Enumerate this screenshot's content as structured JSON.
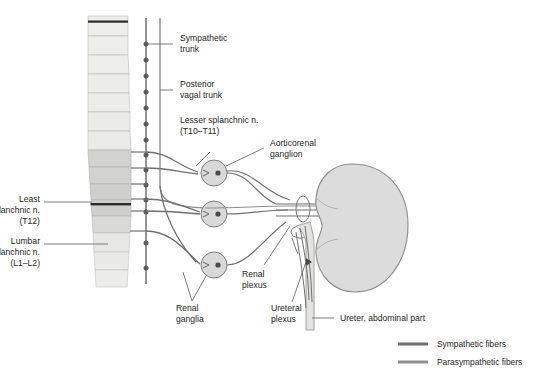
{
  "figure": {
    "type": "anatomical-diagram"
  },
  "colors": {
    "background": "#ffffff",
    "vertebra_light": "#eeeeec",
    "vertebra_mid": "#d6d6d4",
    "vertebra_dark": "#c2c2c0",
    "vertebra_band": "#2b2b2b",
    "kidney_fill": "#dcdcdc",
    "kidney_stroke": "#8c8c8c",
    "ganglion_fill": "#d9d9d9",
    "ganglion_stroke": "#6e6e6e",
    "sympathetic": "#6f6f6f",
    "parasympathetic": "#8f8f8f",
    "leader_line": "#5a5a5a",
    "text": "#231f20"
  },
  "labels": {
    "sympathetic_trunk": {
      "line1": "Sympathetic",
      "line2": "trunk"
    },
    "posterior_vagal_trunk": {
      "line1": "Posterior",
      "line2": "vagal trunk"
    },
    "lesser_splanchnic": {
      "line1": "Lesser splanchnic n.",
      "line2": "(T10–T11)"
    },
    "aorticorenal_ganglion": {
      "line1": "Aorticorenal",
      "line2": "ganglion"
    },
    "least_splanchnic": {
      "line1": "Least",
      "line2": "splanchnic n.",
      "line3": "(T12)"
    },
    "lumbar_splanchnic": {
      "line1": "Lumbar",
      "line2": "splanchnic n.",
      "line3": "(L1–L2)"
    },
    "renal_ganglia": {
      "line1": "Renal",
      "line2": "ganglia"
    },
    "renal_plexus": {
      "line1": "Renal",
      "line2": "plexus"
    },
    "ureteral_plexus": {
      "line1": "Ureteral",
      "line2": "plexus"
    },
    "ureter": {
      "line1": "Ureter, abdominal part"
    }
  },
  "legend": {
    "items": [
      {
        "label": "Sympathetic fibers",
        "color": "#6f6f6f"
      },
      {
        "label": "Parasympathetic fibers",
        "color": "#8f8f8f"
      }
    ]
  },
  "structures": {
    "vertebral_column": "vertebral-column",
    "kidney": "kidney",
    "ureter": "ureter",
    "ganglia_count": 3,
    "sympathetic_trunk_ganglia_count": 13
  }
}
